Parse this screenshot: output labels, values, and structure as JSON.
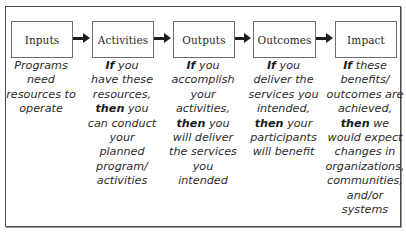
{
  "diagram": {
    "type": "logic-model-flow",
    "stages": [
      {
        "id": "inputs",
        "label": "Inputs",
        "description_lines": [
          [
            {
              "t": "Programs",
              "b": false
            }
          ],
          [
            {
              "t": "need",
              "b": false
            }
          ],
          [
            {
              "t": "resources to",
              "b": false
            }
          ],
          [
            {
              "t": "operate",
              "b": false
            }
          ]
        ]
      },
      {
        "id": "activities",
        "label": "Activities",
        "description_lines": [
          [
            {
              "t": "If",
              "b": true
            },
            {
              "t": " you",
              "b": false
            }
          ],
          [
            {
              "t": "have these",
              "b": false
            }
          ],
          [
            {
              "t": "resources,",
              "b": false
            }
          ],
          [
            {
              "t": "then",
              "b": true
            },
            {
              "t": " you",
              "b": false
            }
          ],
          [
            {
              "t": "can conduct",
              "b": false
            }
          ],
          [
            {
              "t": "your",
              "b": false
            }
          ],
          [
            {
              "t": "planned",
              "b": false
            }
          ],
          [
            {
              "t": "program/",
              "b": false
            }
          ],
          [
            {
              "t": "activities",
              "b": false
            }
          ]
        ]
      },
      {
        "id": "outputs",
        "label": "Outputs",
        "description_lines": [
          [
            {
              "t": "If",
              "b": true
            },
            {
              "t": " you",
              "b": false
            }
          ],
          [
            {
              "t": "accomplish",
              "b": false
            }
          ],
          [
            {
              "t": "your",
              "b": false
            }
          ],
          [
            {
              "t": "activities,",
              "b": false
            }
          ],
          [
            {
              "t": "then",
              "b": true
            },
            {
              "t": " you",
              "b": false
            }
          ],
          [
            {
              "t": "will deliver",
              "b": false
            }
          ],
          [
            {
              "t": "the services",
              "b": false
            }
          ],
          [
            {
              "t": "you",
              "b": false
            }
          ],
          [
            {
              "t": "intended",
              "b": false
            }
          ]
        ]
      },
      {
        "id": "outcomes",
        "label": "Outcomes",
        "description_lines": [
          [
            {
              "t": "If",
              "b": true
            },
            {
              "t": " you",
              "b": false
            }
          ],
          [
            {
              "t": "deliver the",
              "b": false
            }
          ],
          [
            {
              "t": "services you",
              "b": false
            }
          ],
          [
            {
              "t": "intended,",
              "b": false
            }
          ],
          [
            {
              "t": "then",
              "b": true
            },
            {
              "t": " your",
              "b": false
            }
          ],
          [
            {
              "t": "participants",
              "b": false
            }
          ],
          [
            {
              "t": "will benefit",
              "b": false
            }
          ]
        ]
      },
      {
        "id": "impact",
        "label": "Impact",
        "description_lines": [
          [
            {
              "t": "If",
              "b": true
            },
            {
              "t": " these",
              "b": false
            }
          ],
          [
            {
              "t": "benefits/",
              "b": false
            }
          ],
          [
            {
              "t": "outcomes are",
              "b": false
            }
          ],
          [
            {
              "t": "achieved,",
              "b": false
            }
          ],
          [
            {
              "t": "then",
              "b": true
            },
            {
              "t": " we",
              "b": false
            }
          ],
          [
            {
              "t": "would expect",
              "b": false
            }
          ],
          [
            {
              "t": "changes in",
              "b": false
            }
          ],
          [
            {
              "t": "organizations,",
              "b": false
            }
          ],
          [
            {
              "t": "communities,",
              "b": false
            }
          ],
          [
            {
              "t": "and/or",
              "b": false
            }
          ],
          [
            {
              "t": "systems",
              "b": false
            }
          ]
        ]
      }
    ],
    "arrows": [
      {
        "from": "inputs",
        "to": "activities"
      },
      {
        "from": "activities",
        "to": "outputs"
      },
      {
        "from": "outputs",
        "to": "outcomes"
      },
      {
        "from": "outcomes",
        "to": "impact"
      }
    ],
    "colors": {
      "frame": "#4a4a4a",
      "box_border": "#6e6e6e",
      "arrow": "#1e1e1e",
      "text": "#2c2c2c",
      "background": "#ffffff"
    }
  }
}
